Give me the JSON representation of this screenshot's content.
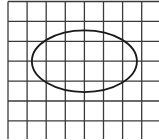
{
  "figure": {
    "grid": {
      "columns_visible": 8,
      "rows_visible": 7,
      "line_color": "#3a3a3a"
    },
    "ellipse": {
      "center_cell": [
        4,
        3
      ],
      "semi_axis_x_cells": 2.75,
      "semi_axis_y_cells": 1.55,
      "stroke_color": "#1a1a1a"
    }
  }
}
